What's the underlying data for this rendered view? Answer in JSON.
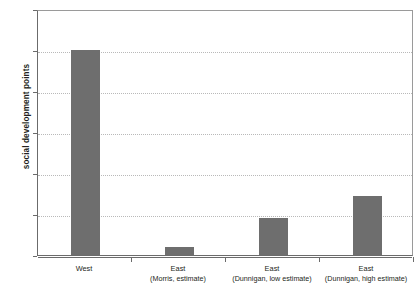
{
  "chart_data": {
    "type": "bar",
    "title": "",
    "xlabel": "",
    "ylabel": "social development points",
    "ylim": [
      0,
      300
    ],
    "yticks": [
      0,
      50,
      100,
      150,
      200,
      250,
      300
    ],
    "ytick_labels": [
      "0",
      "50",
      "100",
      "150",
      "200",
      "250",
      "300"
    ],
    "grid": true,
    "legend": "none",
    "bar_color": "#6e6e6e",
    "categories": [
      "West",
      "East\n(Morris, estimate)",
      "East\n(Dunnigan, low estimate)",
      "East\n(Dunnigan, high estimate)"
    ],
    "values": [
      250,
      10,
      45,
      72
    ],
    "bars": [
      {
        "name": "West",
        "sub": "",
        "value": 250
      },
      {
        "name": "East",
        "sub": "(Morris, estimate)",
        "value": 10
      },
      {
        "name": "East",
        "sub": "(Dunnigan, low estimate)",
        "value": 45
      },
      {
        "name": "East",
        "sub": "(Dunnigan, high estimate)",
        "value": 72
      }
    ]
  }
}
